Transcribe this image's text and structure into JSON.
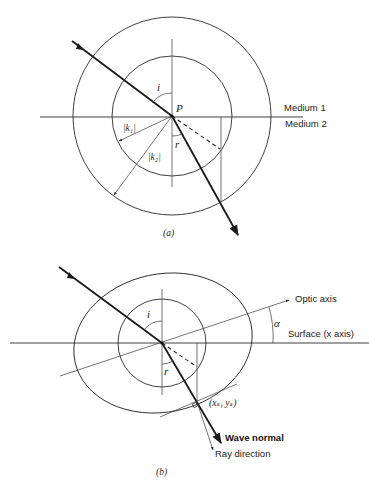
{
  "figure_a": {
    "caption": "(a)",
    "labels": {
      "point": "P",
      "incidence_angle": "i",
      "refraction_angle": "r",
      "k1": "|k₁|",
      "k2": "|k₂|",
      "medium1": "Medium 1",
      "medium2": "Medium 2"
    },
    "geometry": {
      "center": [
        172,
        116
      ],
      "inner_radius": 60,
      "outer_radius": 99
    }
  },
  "figure_b": {
    "caption": "(b)",
    "labels": {
      "incidence_angle": "i",
      "refraction_angle": "r",
      "optic_axis": "Optic axis",
      "alpha": "α",
      "surface": "Surface (x axis)",
      "tangent_point": "(xₛ, yₛ)",
      "wave_normal": "Wave normal",
      "ray_direction": "Ray direction"
    },
    "geometry": {
      "center": [
        162,
        343
      ],
      "inner_radius": 44
    }
  },
  "colors": {
    "stroke": "#2a2a2a",
    "background": "#ffffff"
  }
}
